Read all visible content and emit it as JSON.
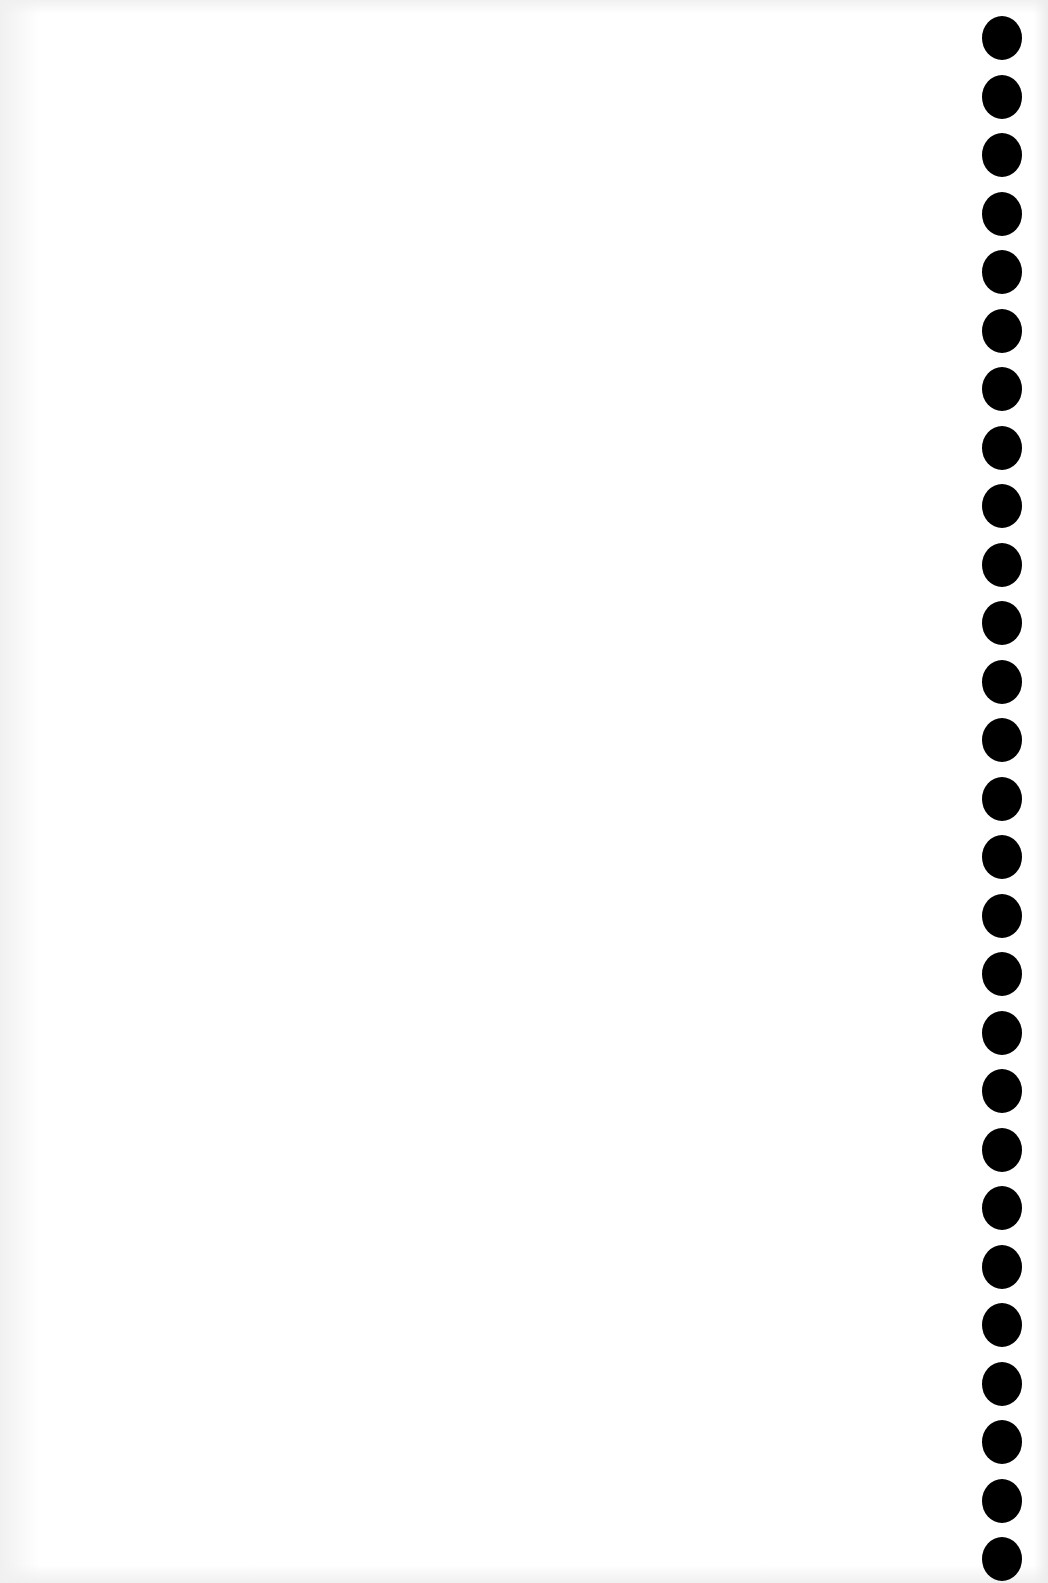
{
  "page": {
    "type": "blank-punched-sheet",
    "background_color": "#ffffff",
    "hole_color": "#000000",
    "binding_holes": {
      "count": 27,
      "side": "right",
      "center_x": 1002,
      "first_center_y": 38,
      "spacing": 58.5,
      "diameter": 42
    }
  }
}
